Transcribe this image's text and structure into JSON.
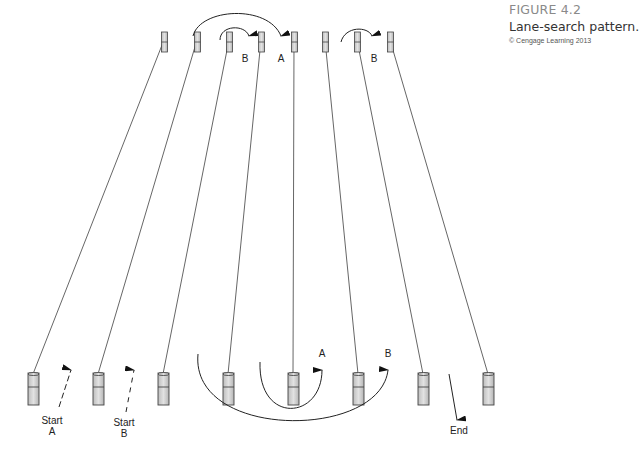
{
  "caption": {
    "figure_number": "FIGURE 4.2",
    "title": "Lane-search pattern.",
    "credit": "© Cengage Learning 2013"
  },
  "diagram": {
    "top_cone_x": [
      164,
      197,
      229,
      261,
      294,
      325,
      357,
      390
    ],
    "bottom_cone_x": [
      33,
      98,
      163,
      228,
      293,
      358,
      423,
      488
    ],
    "labels": {
      "top_b_left": "B",
      "top_a": "A",
      "top_b_right": "B",
      "bottom_a": "A",
      "bottom_b": "B",
      "start_a_line1": "Start",
      "start_a_line2": "A",
      "start_b_line1": "Start",
      "start_b_line2": "B",
      "end": "End"
    }
  }
}
